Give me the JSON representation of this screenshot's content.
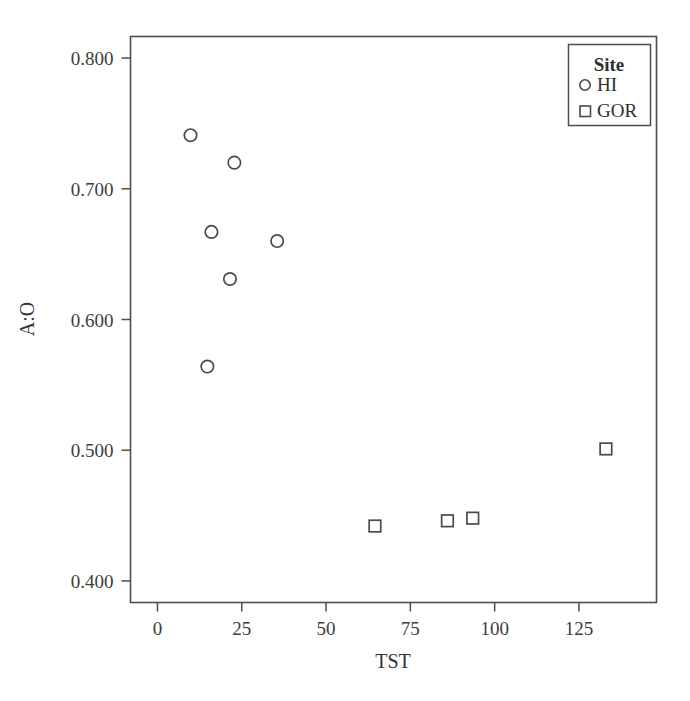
{
  "chart_data": {
    "type": "scatter",
    "title": "",
    "xlabel": "TST",
    "ylabel": "A:O",
    "xlim": [
      -8,
      148
    ],
    "ylim": [
      0.3835,
      0.8165
    ],
    "xticks": [
      0,
      25,
      50,
      75,
      100,
      125
    ],
    "xticklabels": [
      "0",
      "25",
      "50",
      "75",
      "100",
      "125"
    ],
    "yticks": [
      0.4,
      0.5,
      0.6,
      0.7,
      0.8
    ],
    "yticklabels": [
      "0.400",
      "0.500",
      "0.600",
      "0.700",
      "0.800"
    ],
    "grid": false,
    "legend": {
      "title": "Site",
      "position": "top-right",
      "entries": [
        {
          "name": "HI",
          "marker": "circle"
        },
        {
          "name": "GOR",
          "marker": "square"
        }
      ]
    },
    "series": [
      {
        "name": "HI",
        "marker": "circle",
        "color": "#4a4a4a",
        "points": [
          {
            "x": 9.8,
            "y": 0.741
          },
          {
            "x": 14.8,
            "y": 0.564
          },
          {
            "x": 16.0,
            "y": 0.667
          },
          {
            "x": 21.5,
            "y": 0.631
          },
          {
            "x": 22.8,
            "y": 0.72
          },
          {
            "x": 35.5,
            "y": 0.66
          }
        ]
      },
      {
        "name": "GOR",
        "marker": "square",
        "color": "#4a4a4a",
        "points": [
          {
            "x": 64.5,
            "y": 0.442
          },
          {
            "x": 86.0,
            "y": 0.446
          },
          {
            "x": 93.5,
            "y": 0.448
          },
          {
            "x": 133.0,
            "y": 0.501
          }
        ]
      }
    ]
  },
  "colors": {
    "axis": "#4d4d4d",
    "marker": "#4a4a4a",
    "text": "#333333",
    "background": "#ffffff"
  }
}
